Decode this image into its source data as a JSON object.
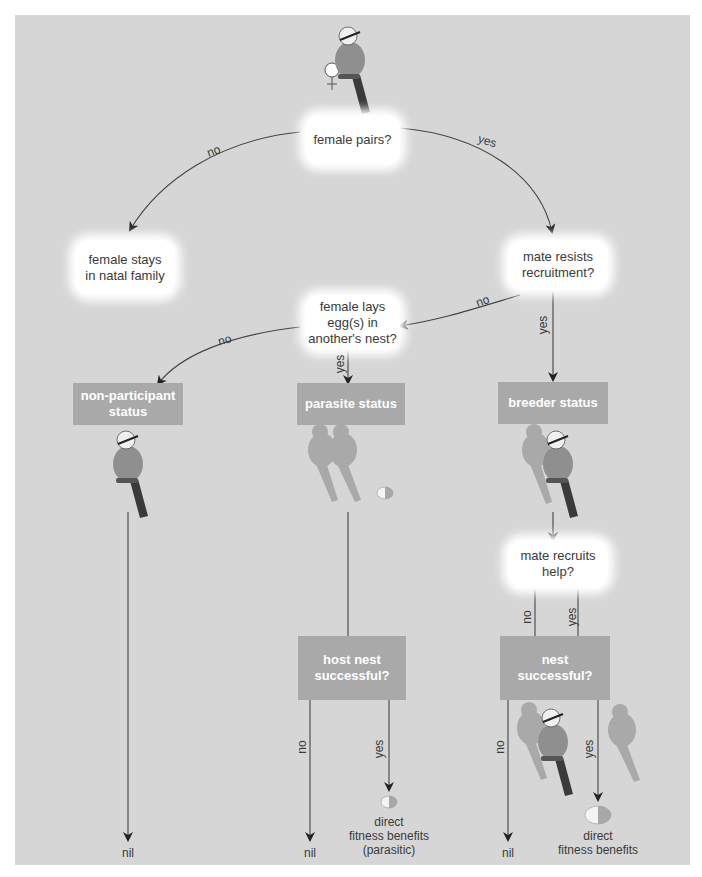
{
  "diagram": {
    "type": "decision-flowchart",
    "subject_symbol": "♀",
    "colors": {
      "background": "#d6d6d6",
      "question_box": "#ffffff",
      "status_box": "#a9a9a9",
      "status_text": "#ffffff",
      "line": "#444444",
      "text": "#3a3a3a"
    },
    "questions": {
      "female_pairs": "female pairs?",
      "mate_resists": "mate resists\nrecruitment?",
      "female_lays": "female lays\negg(s) in\nanother's nest?",
      "mate_recruits": "mate recruits\nhelp?"
    },
    "outcomes_box": {
      "stays": "female stays\nin natal family"
    },
    "statuses": {
      "non_participant": "non-participant\nstatus",
      "parasite": "parasite status",
      "breeder": "breeder status",
      "host_nest": "host nest\nsuccessful?",
      "nest": "nest\nsuccessful?"
    },
    "edge_labels": {
      "pairs_no": "no",
      "pairs_yes": "yes",
      "resists_no": "no",
      "resists_yes": "yes",
      "lays_no": "no",
      "lays_yes": "yes",
      "recruits_no": "no",
      "recruits_yes": "yes",
      "host_no": "no",
      "host_yes": "yes",
      "nest_no": "no",
      "nest_yes": "yes"
    },
    "results": {
      "nil_left": "nil",
      "nil_middle": "nil",
      "nil_right": "nil",
      "parasitic_benefits": "direct\nfitness benefits\n(parasitic)",
      "direct_benefits": "direct\nfitness benefits"
    }
  }
}
